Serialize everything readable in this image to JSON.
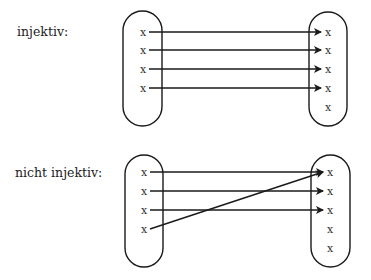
{
  "diagrams": [
    {
      "label": "injektiv:",
      "label_pos": {
        "x": 17,
        "y": 24
      },
      "domain_oval": {
        "x": 123,
        "y": 11,
        "w": 39,
        "h": 115
      },
      "codomain_oval": {
        "x": 309,
        "y": 12,
        "w": 38,
        "h": 114
      },
      "domain_points": [
        {
          "symbol": "x",
          "x": 143,
          "y": 32
        },
        {
          "symbol": "x",
          "x": 143,
          "y": 50
        },
        {
          "symbol": "x",
          "x": 143,
          "y": 69
        },
        {
          "symbol": "x",
          "x": 143,
          "y": 88
        }
      ],
      "codomain_points": [
        {
          "symbol": "x",
          "x": 328,
          "y": 32
        },
        {
          "symbol": "x",
          "x": 328,
          "y": 50
        },
        {
          "symbol": "x",
          "x": 328,
          "y": 69
        },
        {
          "symbol": "x",
          "x": 328,
          "y": 88
        },
        {
          "symbol": "x",
          "x": 328,
          "y": 107
        }
      ],
      "mappings": [
        {
          "from": 0,
          "to": 0
        },
        {
          "from": 1,
          "to": 1
        },
        {
          "from": 2,
          "to": 2
        },
        {
          "from": 3,
          "to": 3
        }
      ]
    },
    {
      "label": "nicht injektiv:",
      "label_pos": {
        "x": 15,
        "y": 165
      },
      "domain_oval": {
        "x": 125,
        "y": 155,
        "w": 38,
        "h": 112
      },
      "codomain_oval": {
        "x": 311,
        "y": 155,
        "w": 39,
        "h": 112
      },
      "domain_points": [
        {
          "symbol": "x",
          "x": 144,
          "y": 172
        },
        {
          "symbol": "x",
          "x": 144,
          "y": 191
        },
        {
          "symbol": "x",
          "x": 144,
          "y": 210
        },
        {
          "symbol": "x",
          "x": 144,
          "y": 229
        }
      ],
      "codomain_points": [
        {
          "symbol": "x",
          "x": 330,
          "y": 172
        },
        {
          "symbol": "x",
          "x": 330,
          "y": 191
        },
        {
          "symbol": "x",
          "x": 330,
          "y": 210
        },
        {
          "symbol": "x",
          "x": 330,
          "y": 229
        },
        {
          "symbol": "x",
          "x": 330,
          "y": 248
        }
      ],
      "mappings": [
        {
          "from": 0,
          "to": 0
        },
        {
          "from": 1,
          "to": 1
        },
        {
          "from": 2,
          "to": 2
        },
        {
          "from": 3,
          "to": 0
        }
      ]
    }
  ],
  "colors": {
    "stroke": "#1a1a1a",
    "text": "#222222"
  }
}
